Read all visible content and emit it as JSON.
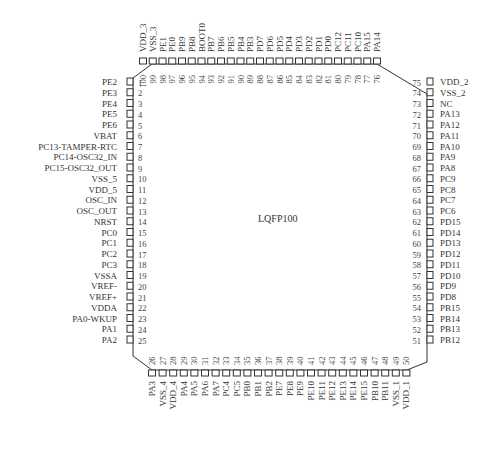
{
  "package": {
    "name": "LQFP100",
    "outline_color": "#333333",
    "background": "#ffffff"
  },
  "pins": {
    "left": [
      {
        "num": 1,
        "name": "PE2"
      },
      {
        "num": 2,
        "name": "PE3"
      },
      {
        "num": 3,
        "name": "PE4"
      },
      {
        "num": 4,
        "name": "PE5"
      },
      {
        "num": 5,
        "name": "PE6"
      },
      {
        "num": 6,
        "name": "VBAT"
      },
      {
        "num": 7,
        "name": "PC13-TAMPER-RTC"
      },
      {
        "num": 8,
        "name": "PC14-OSC32_IN"
      },
      {
        "num": 9,
        "name": "PC15-OSC32_OUT"
      },
      {
        "num": 10,
        "name": "VSS_5"
      },
      {
        "num": 11,
        "name": "VDD_5"
      },
      {
        "num": 12,
        "name": "OSC_IN"
      },
      {
        "num": 13,
        "name": "OSC_OUT"
      },
      {
        "num": 14,
        "name": "NRST"
      },
      {
        "num": 15,
        "name": "PC0"
      },
      {
        "num": 16,
        "name": "PC1"
      },
      {
        "num": 17,
        "name": "PC2"
      },
      {
        "num": 18,
        "name": "PC3"
      },
      {
        "num": 19,
        "name": "VSSA"
      },
      {
        "num": 20,
        "name": "VREF-"
      },
      {
        "num": 21,
        "name": "VREF+"
      },
      {
        "num": 22,
        "name": "VDDA"
      },
      {
        "num": 23,
        "name": "PA0-WKUP"
      },
      {
        "num": 24,
        "name": "PA1"
      },
      {
        "num": 25,
        "name": "PA2"
      }
    ],
    "bottom": [
      {
        "num": 26,
        "name": "PA3"
      },
      {
        "num": 27,
        "name": "VSS_4"
      },
      {
        "num": 28,
        "name": "VDD_4"
      },
      {
        "num": 29,
        "name": "PA4"
      },
      {
        "num": 30,
        "name": "PA5"
      },
      {
        "num": 31,
        "name": "PA6"
      },
      {
        "num": 32,
        "name": "PA7"
      },
      {
        "num": 33,
        "name": "PC4"
      },
      {
        "num": 34,
        "name": "PC5"
      },
      {
        "num": 35,
        "name": "PB0"
      },
      {
        "num": 36,
        "name": "PB1"
      },
      {
        "num": 37,
        "name": "PB2"
      },
      {
        "num": 38,
        "name": "PE7"
      },
      {
        "num": 39,
        "name": "PE8"
      },
      {
        "num": 40,
        "name": "PE9"
      },
      {
        "num": 41,
        "name": "PE10"
      },
      {
        "num": 42,
        "name": "PE11"
      },
      {
        "num": 43,
        "name": "PE12"
      },
      {
        "num": 44,
        "name": "PE13"
      },
      {
        "num": 45,
        "name": "PE14"
      },
      {
        "num": 46,
        "name": "PE15"
      },
      {
        "num": 47,
        "name": "PB10"
      },
      {
        "num": 48,
        "name": "PB11"
      },
      {
        "num": 49,
        "name": "VSS_1"
      },
      {
        "num": 50,
        "name": "VDD_1"
      }
    ],
    "right": [
      {
        "num": 51,
        "name": "PB12"
      },
      {
        "num": 52,
        "name": "PB13"
      },
      {
        "num": 53,
        "name": "PB14"
      },
      {
        "num": 54,
        "name": "PB15"
      },
      {
        "num": 55,
        "name": "PD8"
      },
      {
        "num": 56,
        "name": "PD9"
      },
      {
        "num": 57,
        "name": "PD10"
      },
      {
        "num": 58,
        "name": "PD11"
      },
      {
        "num": 59,
        "name": "PD12"
      },
      {
        "num": 60,
        "name": "PD13"
      },
      {
        "num": 61,
        "name": "PD14"
      },
      {
        "num": 62,
        "name": "PD15"
      },
      {
        "num": 63,
        "name": "PC6"
      },
      {
        "num": 64,
        "name": "PC7"
      },
      {
        "num": 65,
        "name": "PC8"
      },
      {
        "num": 66,
        "name": "PC9"
      },
      {
        "num": 67,
        "name": "PA8"
      },
      {
        "num": 68,
        "name": "PA9"
      },
      {
        "num": 69,
        "name": "PA10"
      },
      {
        "num": 70,
        "name": "PA11"
      },
      {
        "num": 71,
        "name": "PA12"
      },
      {
        "num": 72,
        "name": "PA13"
      },
      {
        "num": 73,
        "name": "NC"
      },
      {
        "num": 74,
        "name": "VSS_2"
      },
      {
        "num": 75,
        "name": "VDD_2"
      }
    ],
    "top": [
      {
        "num": 76,
        "name": "PA14"
      },
      {
        "num": 77,
        "name": "PA15"
      },
      {
        "num": 78,
        "name": "PC10"
      },
      {
        "num": 79,
        "name": "PC11"
      },
      {
        "num": 80,
        "name": "PC12"
      },
      {
        "num": 81,
        "name": "PD0"
      },
      {
        "num": 82,
        "name": "PD1"
      },
      {
        "num": 83,
        "name": "PD2"
      },
      {
        "num": 84,
        "name": "PD3"
      },
      {
        "num": 85,
        "name": "PD4"
      },
      {
        "num": 86,
        "name": "PD5"
      },
      {
        "num": 87,
        "name": "PD6"
      },
      {
        "num": 88,
        "name": "PD7"
      },
      {
        "num": 89,
        "name": "PB3"
      },
      {
        "num": 90,
        "name": "PB4"
      },
      {
        "num": 91,
        "name": "PB5"
      },
      {
        "num": 92,
        "name": "PB6"
      },
      {
        "num": 93,
        "name": "PB7"
      },
      {
        "num": 94,
        "name": "BOOT0"
      },
      {
        "num": 95,
        "name": "PB8"
      },
      {
        "num": 96,
        "name": "PB9"
      },
      {
        "num": 97,
        "name": "PE0"
      },
      {
        "num": 98,
        "name": "PE1"
      },
      {
        "num": 99,
        "name": "VSS_3"
      },
      {
        "num": 100,
        "name": "VDD_3"
      }
    ]
  }
}
